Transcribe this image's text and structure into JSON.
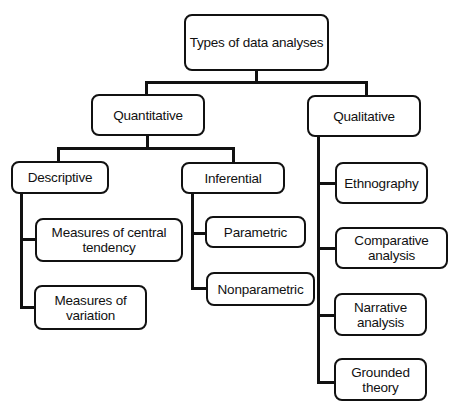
{
  "diagram": {
    "root": {
      "label": "Types of data analyses"
    },
    "quantitative": {
      "label": "Quantitative",
      "descriptive": {
        "label": "Descriptive",
        "children": [
          {
            "label": "Measures of central tendency",
            "lines": [
              "Measures of central",
              "tendency"
            ]
          },
          {
            "label": "Measures of variation",
            "lines": [
              "Measures of",
              "variation"
            ]
          }
        ]
      },
      "inferential": {
        "label": "Inferential",
        "children": [
          {
            "label": "Parametric"
          },
          {
            "label": "Nonparametric"
          }
        ]
      }
    },
    "qualitative": {
      "label": "Qualitative",
      "children": [
        {
          "label": "Ethnography",
          "lines": [
            "Ethnography"
          ]
        },
        {
          "label": "Comparative analysis",
          "lines": [
            "Comparative",
            "analysis"
          ]
        },
        {
          "label": "Narrative analysis",
          "lines": [
            "Narrative",
            "analysis"
          ]
        },
        {
          "label": "Grounded theory",
          "lines": [
            "Grounded",
            "theory"
          ]
        }
      ]
    }
  },
  "colors": {
    "stroke": "#111111",
    "fill": "#ffffff",
    "background": "#ffffff"
  }
}
